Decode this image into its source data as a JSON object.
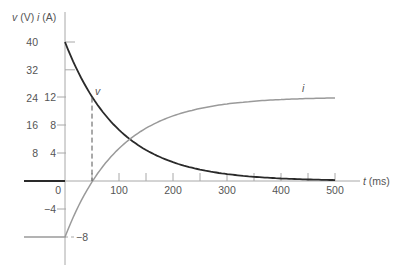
{
  "chart_data": {
    "type": "line",
    "title": "",
    "xlabel_var": "t",
    "xlabel_unit": "(ms)",
    "ylabel_v_var": "v",
    "ylabel_v_unit": "(V)",
    "ylabel_i_var": "i",
    "ylabel_i_unit": "(A)",
    "xlim": [
      -75,
      500
    ],
    "x_ticks": [
      0,
      50,
      100,
      150,
      200,
      250,
      300,
      350,
      400,
      450,
      500
    ],
    "x_tick_labels": [
      {
        "value": 0,
        "label": "0"
      },
      {
        "value": 100,
        "label": "100"
      },
      {
        "value": 200,
        "label": "200"
      },
      {
        "value": 300,
        "label": "300"
      },
      {
        "value": 400,
        "label": "400"
      },
      {
        "value": 500,
        "label": "500"
      }
    ],
    "v_axis": {
      "ylim": [
        -20,
        40
      ],
      "ticks": [
        8,
        16,
        24,
        32,
        40
      ],
      "labels": [
        "8",
        "16",
        "24",
        "32",
        "40"
      ]
    },
    "i_axis": {
      "ylim": [
        -10,
        14
      ],
      "ticks": [
        -8,
        -4,
        4,
        8,
        12
      ],
      "labels": [
        "-8",
        "-4",
        "4",
        "8",
        "12"
      ]
    },
    "series": [
      {
        "name": "v",
        "unit": "V",
        "color": "#2a2a2a",
        "description": "v = 0 for t<0; v = 40 e^(-t/100) for t>=0",
        "x": [
          -75,
          0,
          0,
          50,
          100,
          150,
          200,
          250,
          300,
          350,
          400,
          450,
          500
        ],
        "values": [
          0,
          0,
          40,
          24.3,
          14.7,
          8.9,
          5.4,
          3.3,
          2.0,
          1.2,
          0.7,
          0.4,
          0.3
        ]
      },
      {
        "name": "i",
        "unit": "A",
        "color": "#9a9a9a",
        "description": "i = -8 for t<0; i = 12 - 20 e^(-t/100) for t>=0",
        "x": [
          -75,
          0,
          50,
          100,
          150,
          200,
          250,
          300,
          350,
          400,
          450,
          500
        ],
        "values": [
          -8,
          -8,
          -0.1,
          4.6,
          7.5,
          9.3,
          10.4,
          11.0,
          11.4,
          11.6,
          11.8,
          11.9
        ]
      }
    ],
    "annotations": [
      {
        "text": "v",
        "at_t": 55,
        "near": "v curve"
      },
      {
        "text": "i",
        "at_t": 450,
        "near": "i curve"
      },
      {
        "type": "dashed-vertical",
        "t": 50,
        "from": 0,
        "to_v": 24
      }
    ],
    "grid": false,
    "legend": "none (inline curve labels)"
  }
}
